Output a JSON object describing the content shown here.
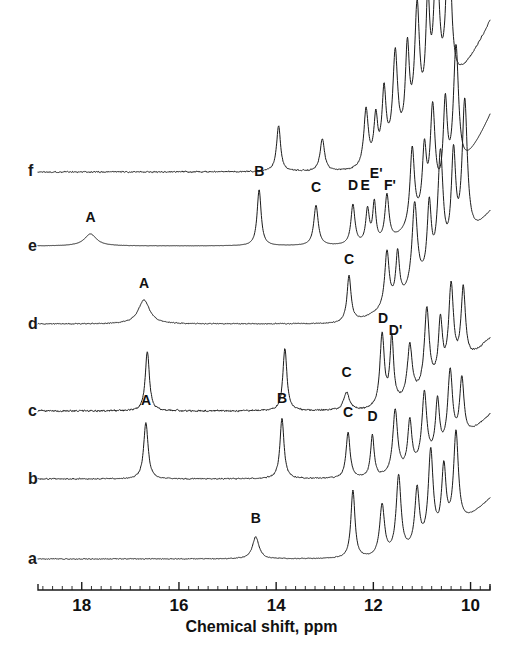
{
  "figure": {
    "background": "#ffffff",
    "ink": "#1a1a1a",
    "axis_title": "Chemical shift, ppm"
  },
  "axis": {
    "label": "Chemical shift, ppm",
    "min_ppm": 9.6,
    "max_ppm": 18.9,
    "direction": "reversed",
    "px_left": 38,
    "px_right": 490,
    "major_ticks": [
      18,
      16,
      14,
      12,
      10
    ],
    "major_tick_labels": [
      "18",
      "16",
      "14",
      "12",
      "10"
    ],
    "minor_tick_step": 0.2,
    "y_px": 590
  },
  "traces": [
    {
      "id": "f",
      "label": "f",
      "baseline_px": 172,
      "label_x_px": 28,
      "label_y_px": 163,
      "noise": 1.0,
      "peaks": [
        {
          "ppm": 13.95,
          "height": 46,
          "width": 0.1
        },
        {
          "ppm": 13.05,
          "height": 32,
          "width": 0.11
        },
        {
          "ppm": 12.15,
          "height": 56,
          "width": 0.11
        },
        {
          "ppm": 11.95,
          "height": 44,
          "width": 0.09
        },
        {
          "ppm": 11.78,
          "height": 66,
          "width": 0.1
        },
        {
          "ppm": 11.55,
          "height": 96,
          "width": 0.12
        },
        {
          "ppm": 11.3,
          "height": 88,
          "width": 0.1
        },
        {
          "ppm": 11.1,
          "height": 120,
          "width": 0.12
        },
        {
          "ppm": 10.88,
          "height": 108,
          "width": 0.1
        },
        {
          "ppm": 10.7,
          "height": 150,
          "width": 0.13
        },
        {
          "ppm": 10.45,
          "height": 168,
          "width": 0.12
        }
      ],
      "ramp": {
        "start_ppm": 12.6,
        "rise": 150,
        "power": 2.1
      }
    },
    {
      "id": "e",
      "label": "e",
      "baseline_px": 246,
      "label_x_px": 28,
      "label_y_px": 238,
      "noise": 0.18,
      "peaks": [
        {
          "ppm": 17.82,
          "height": 12,
          "width": 0.3
        },
        {
          "ppm": 14.35,
          "height": 56,
          "width": 0.1
        },
        {
          "ppm": 13.18,
          "height": 40,
          "width": 0.11
        },
        {
          "ppm": 12.42,
          "height": 40,
          "width": 0.1
        },
        {
          "ppm": 12.12,
          "height": 34,
          "width": 0.09
        },
        {
          "ppm": 11.98,
          "height": 40,
          "width": 0.08
        },
        {
          "ppm": 11.72,
          "height": 46,
          "width": 0.1
        },
        {
          "ppm": 11.2,
          "height": 78,
          "width": 0.11
        },
        {
          "ppm": 10.95,
          "height": 64,
          "width": 0.1
        },
        {
          "ppm": 10.78,
          "height": 98,
          "width": 0.12
        },
        {
          "ppm": 10.52,
          "height": 86,
          "width": 0.1
        },
        {
          "ppm": 10.3,
          "height": 130,
          "width": 0.13
        }
      ],
      "ramp": {
        "start_ppm": 12.2,
        "rise": 130,
        "power": 2.2
      },
      "peak_labels": [
        {
          "text": "A",
          "ppm": 17.82,
          "dy": 22
        },
        {
          "text": "B",
          "ppm": 14.35,
          "dy": 68
        },
        {
          "text": "C",
          "ppm": 13.18,
          "dy": 52
        },
        {
          "text": "D",
          "ppm": 12.42,
          "dy": 54
        },
        {
          "text": "E",
          "ppm": 12.16,
          "dy": 54
        },
        {
          "text": "E'",
          "ppm": 11.97,
          "dy": 66
        },
        {
          "text": "F'",
          "ppm": 11.68,
          "dy": 54
        }
      ]
    },
    {
      "id": "d",
      "label": "d",
      "baseline_px": 324,
      "label_x_px": 28,
      "label_y_px": 316,
      "noise": 0.7,
      "peaks": [
        {
          "ppm": 16.72,
          "height": 24,
          "width": 0.28
        },
        {
          "ppm": 12.5,
          "height": 46,
          "width": 0.1
        },
        {
          "ppm": 11.72,
          "height": 56,
          "width": 0.11
        },
        {
          "ppm": 11.5,
          "height": 48,
          "width": 0.09
        },
        {
          "ppm": 11.15,
          "height": 86,
          "width": 0.13
        },
        {
          "ppm": 10.85,
          "height": 70,
          "width": 0.1
        },
        {
          "ppm": 10.62,
          "height": 112,
          "width": 0.13
        },
        {
          "ppm": 10.35,
          "height": 96,
          "width": 0.11
        },
        {
          "ppm": 10.12,
          "height": 140,
          "width": 0.13
        }
      ],
      "ramp": {
        "start_ppm": 12.9,
        "rise": 110,
        "power": 2.0
      },
      "peak_labels": [
        {
          "text": "A",
          "ppm": 16.72,
          "dy": 34
        },
        {
          "text": "C",
          "ppm": 12.5,
          "dy": 58
        }
      ]
    },
    {
      "id": "c",
      "label": "c",
      "baseline_px": 411,
      "label_x_px": 28,
      "label_y_px": 403,
      "noise": 1.3,
      "peaks": [
        {
          "ppm": 16.65,
          "height": 60,
          "width": 0.1
        },
        {
          "ppm": 13.82,
          "height": 62,
          "width": 0.1
        },
        {
          "ppm": 12.55,
          "height": 18,
          "width": 0.14
        },
        {
          "ppm": 11.82,
          "height": 72,
          "width": 0.11
        },
        {
          "ppm": 11.62,
          "height": 66,
          "width": 0.09
        },
        {
          "ppm": 11.25,
          "height": 52,
          "width": 0.12
        },
        {
          "ppm": 10.9,
          "height": 80,
          "width": 0.12
        },
        {
          "ppm": 10.62,
          "height": 58,
          "width": 0.1
        },
        {
          "ppm": 10.4,
          "height": 86,
          "width": 0.12
        },
        {
          "ppm": 10.15,
          "height": 74,
          "width": 0.11
        }
      ],
      "ramp": {
        "start_ppm": 12.3,
        "rise": 72,
        "power": 2.0
      },
      "peak_labels": [
        {
          "text": "C",
          "ppm": 12.55,
          "dy": 32
        },
        {
          "text": "D",
          "ppm": 11.8,
          "dy": 86
        },
        {
          "text": "D'",
          "ppm": 11.58,
          "dy": 74
        }
      ]
    },
    {
      "id": "b",
      "label": "b",
      "baseline_px": 479,
      "label_x_px": 28,
      "label_y_px": 471,
      "noise": 0.9,
      "peaks": [
        {
          "ppm": 16.68,
          "height": 56,
          "width": 0.11
        },
        {
          "ppm": 13.88,
          "height": 60,
          "width": 0.1
        },
        {
          "ppm": 12.52,
          "height": 46,
          "width": 0.1
        },
        {
          "ppm": 12.02,
          "height": 42,
          "width": 0.09
        },
        {
          "ppm": 11.55,
          "height": 64,
          "width": 0.12
        },
        {
          "ppm": 11.25,
          "height": 48,
          "width": 0.1
        },
        {
          "ppm": 10.95,
          "height": 70,
          "width": 0.12
        },
        {
          "ppm": 10.68,
          "height": 54,
          "width": 0.1
        },
        {
          "ppm": 10.42,
          "height": 76,
          "width": 0.12
        },
        {
          "ppm": 10.18,
          "height": 60,
          "width": 0.11
        }
      ],
      "ramp": {
        "start_ppm": 12.1,
        "rise": 64,
        "power": 2.0
      },
      "peak_labels": [
        {
          "text": "A",
          "ppm": 16.68,
          "dy": 72
        },
        {
          "text": "B",
          "ppm": 13.88,
          "dy": 74
        },
        {
          "text": "C",
          "ppm": 12.52,
          "dy": 60
        },
        {
          "text": "D",
          "ppm": 12.02,
          "dy": 56
        }
      ]
    },
    {
      "id": "a",
      "label": "a",
      "baseline_px": 559,
      "label_x_px": 28,
      "label_y_px": 551,
      "noise": 0.6,
      "peaks": [
        {
          "ppm": 14.42,
          "height": 22,
          "width": 0.16
        },
        {
          "ppm": 12.42,
          "height": 68,
          "width": 0.1
        },
        {
          "ppm": 11.82,
          "height": 52,
          "width": 0.12
        },
        {
          "ppm": 11.48,
          "height": 78,
          "width": 0.12
        },
        {
          "ppm": 11.1,
          "height": 58,
          "width": 0.11
        },
        {
          "ppm": 10.82,
          "height": 90,
          "width": 0.12
        },
        {
          "ppm": 10.55,
          "height": 66,
          "width": 0.11
        },
        {
          "ppm": 10.3,
          "height": 94,
          "width": 0.12
        }
      ],
      "ramp": {
        "start_ppm": 12.0,
        "rise": 60,
        "power": 2.0
      },
      "peak_labels": [
        {
          "text": "B",
          "ppm": 14.42,
          "dy": 34
        }
      ]
    }
  ]
}
